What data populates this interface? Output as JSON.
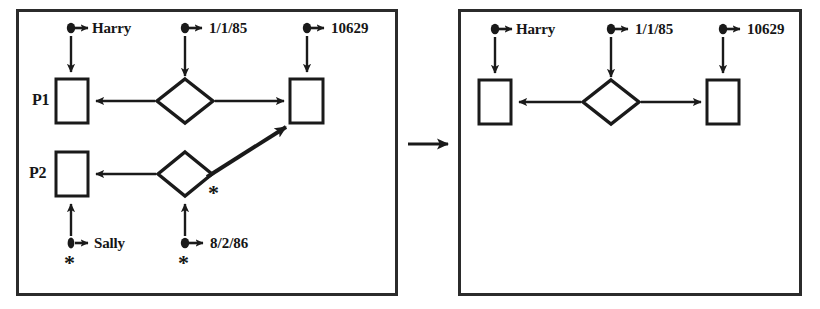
{
  "figure": {
    "background_color": "#ffffff",
    "ink_color": "#1a1a1a",
    "width": 820,
    "height": 309
  },
  "panels": [
    {
      "id": "left",
      "name": "source-graph-panel",
      "attribute_labels": [
        "Harry",
        "1/1/85",
        "10629"
      ],
      "entity_labels": [
        "P1",
        "P2"
      ],
      "value_labels": [
        "Sally",
        "8/2/86"
      ],
      "markers": [
        "*",
        "*",
        "*"
      ],
      "node_count": 3,
      "relationship_count": 2
    },
    {
      "id": "right",
      "name": "target-graph-panel",
      "attribute_labels": [
        "Harry",
        "1/1/85",
        "10629"
      ],
      "entity_labels": [],
      "value_labels": [],
      "markers": [],
      "node_count": 2,
      "relationship_count": 1
    }
  ],
  "left_panel": {
    "top_attributes": [
      {
        "name": "attribute-harry",
        "label": "Harry"
      },
      {
        "name": "attribute-date1",
        "label": "1/1/85"
      },
      {
        "name": "attribute-number",
        "label": "10629"
      }
    ],
    "entities": [
      {
        "name": "entity-p1",
        "label": "P1"
      },
      {
        "name": "entity-p2",
        "label": "P2"
      }
    ],
    "bottom_attributes": [
      {
        "name": "attribute-sally",
        "label": "Sally"
      },
      {
        "name": "attribute-date2",
        "label": "8/2/86"
      }
    ],
    "asterisks": [
      {
        "name": "asterisk-sally",
        "label": "*"
      },
      {
        "name": "asterisk-date2",
        "label": "*"
      },
      {
        "name": "asterisk-diagonal",
        "label": "*"
      }
    ]
  },
  "right_panel": {
    "top_attributes": [
      {
        "name": "attribute-harry",
        "label": "Harry"
      },
      {
        "name": "attribute-date1",
        "label": "1/1/85"
      },
      {
        "name": "attribute-number",
        "label": "10629"
      }
    ]
  },
  "transition": {
    "name": "transform-arrow",
    "label": ""
  }
}
